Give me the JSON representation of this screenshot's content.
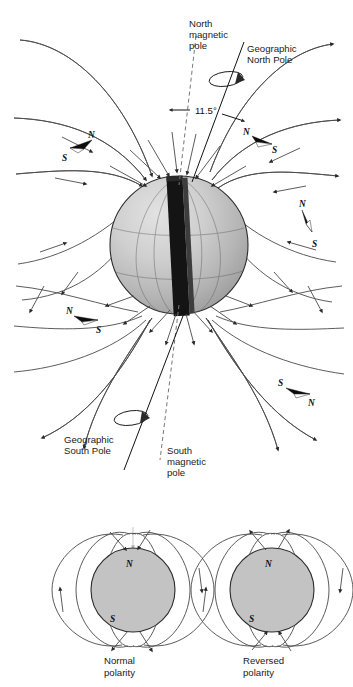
{
  "figure": {
    "title_visible": false,
    "background": "#ffffff"
  },
  "main_diagram": {
    "name": "earth-magnetic-field-diagram",
    "labels": {
      "north_magnetic_pole": "North\nmagnetic\npole",
      "north_magnetic_pole_lines": [
        "North",
        "magnetic",
        "pole"
      ],
      "geographic_north_pole_lines": [
        "Geographic",
        "North Pole"
      ],
      "geographic_south_pole_lines": [
        "Geographic",
        "South Pole"
      ],
      "south_magnetic_pole_lines": [
        "South",
        "magnetic",
        "pole"
      ],
      "tilt_angle": "11.5°"
    },
    "earth": {
      "fill_light": "#d8d8d8",
      "fill_mid": "#bdbdbd",
      "fill_dark": "#9a9a9a",
      "outline": "#2b2b2b"
    },
    "bar_magnet": {
      "color": "#141414",
      "side_color": "#3a3a3a"
    },
    "compass_needles": [
      {
        "id": "needle-upper-left",
        "left_label": "S",
        "right_label": "N"
      },
      {
        "id": "needle-upper-right",
        "left_label": "N",
        "right_label": "S"
      },
      {
        "id": "needle-mid-right",
        "left_label": "N",
        "right_label": "S"
      },
      {
        "id": "needle-lower-left",
        "left_label": "N",
        "right_label": "S"
      },
      {
        "id": "needle-lower-right",
        "left_label": "S",
        "right_label": "N"
      }
    ],
    "field_line_color": "#4a4a4a",
    "arrow_color": "#2a2a2a"
  },
  "polarity_panels": [
    {
      "id": "normal-polarity",
      "caption_lines": [
        "Normal",
        "polarity"
      ],
      "top_pole_label": "N",
      "bottom_pole_label": "S",
      "flow": "into-north-pole"
    },
    {
      "id": "reversed-polarity",
      "caption_lines": [
        "Reversed",
        "polarity"
      ],
      "top_pole_label": "N",
      "bottom_pole_label": "S",
      "flow": "out-of-north-pole"
    }
  ],
  "colors": {
    "sphere_gray": "#c3c3c3",
    "line_gray": "#4a4a4a",
    "text": "#1a1a1a",
    "magnet_black": "#141414"
  }
}
